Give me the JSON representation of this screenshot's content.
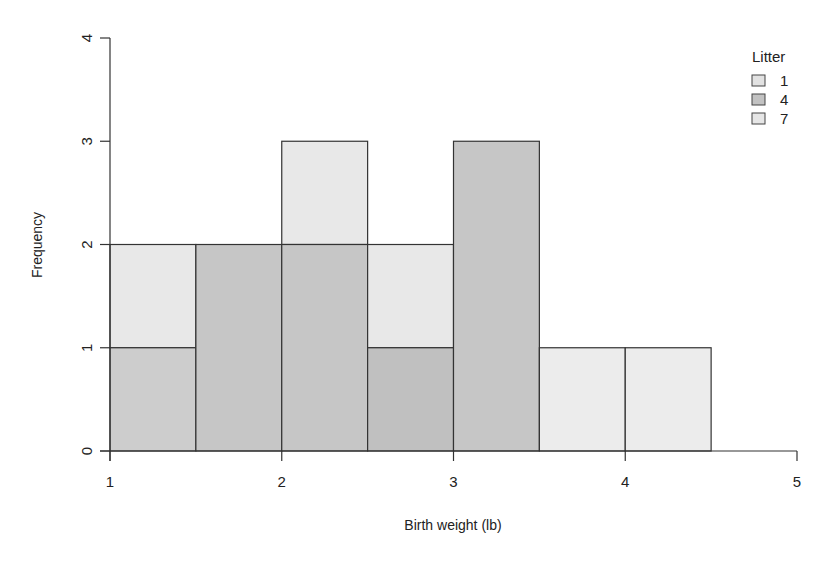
{
  "chart_data": {
    "type": "bar",
    "subtype": "overlaid-histogram",
    "title": "",
    "xlabel": "Birth weight (lb)",
    "ylabel": "Frequency",
    "xlim": [
      1,
      5
    ],
    "ylim": [
      0,
      4
    ],
    "x_ticks": [
      1,
      2,
      3,
      4,
      5
    ],
    "y_ticks": [
      0,
      1,
      2,
      3,
      4
    ],
    "grid": false,
    "bin_width": 0.5,
    "bins": [
      [
        1.0,
        1.5
      ],
      [
        1.5,
        2.0
      ],
      [
        2.0,
        2.5
      ],
      [
        2.5,
        3.0
      ],
      [
        3.0,
        3.5
      ],
      [
        3.5,
        4.0
      ],
      [
        4.0,
        4.5
      ]
    ],
    "bars": [
      {
        "x0": 1.0,
        "x1": 1.5,
        "y0": 1,
        "y1": 2,
        "fill": "#e8e8e8"
      },
      {
        "x0": 1.0,
        "x1": 1.5,
        "y0": 0,
        "y1": 1,
        "fill": "#cdcdcd"
      },
      {
        "x0": 1.5,
        "x1": 2.0,
        "y0": 0,
        "y1": 2,
        "fill": "#c6c6c6"
      },
      {
        "x0": 2.0,
        "x1": 2.5,
        "y0": 2,
        "y1": 3,
        "fill": "#e8e8e8"
      },
      {
        "x0": 2.0,
        "x1": 2.5,
        "y0": 0,
        "y1": 2,
        "fill": "#c6c6c6"
      },
      {
        "x0": 2.5,
        "x1": 3.0,
        "y0": 1,
        "y1": 2,
        "fill": "#e8e8e8"
      },
      {
        "x0": 2.5,
        "x1": 3.0,
        "y0": 0,
        "y1": 1,
        "fill": "#c0c0c0"
      },
      {
        "x0": 3.0,
        "x1": 3.5,
        "y0": 0,
        "y1": 3,
        "fill": "#c6c6c6"
      },
      {
        "x0": 3.5,
        "x1": 4.0,
        "y0": 0,
        "y1": 1,
        "fill": "#ececec"
      },
      {
        "x0": 4.0,
        "x1": 4.5,
        "y0": 0,
        "y1": 1,
        "fill": "#ececec"
      }
    ],
    "totals": [
      2,
      2,
      3,
      2,
      3,
      1,
      1
    ],
    "legend": {
      "title": "Litter",
      "position": "top-right",
      "entries": [
        {
          "label": "1",
          "fill": "#e2e2e2"
        },
        {
          "label": "4",
          "fill": "#c2c2c2"
        },
        {
          "label": "7",
          "fill": "#e6e6e6"
        }
      ]
    }
  },
  "labels": {
    "xlabel": "Birth weight (lb)",
    "ylabel": "Frequency",
    "legend_title": "Litter"
  }
}
